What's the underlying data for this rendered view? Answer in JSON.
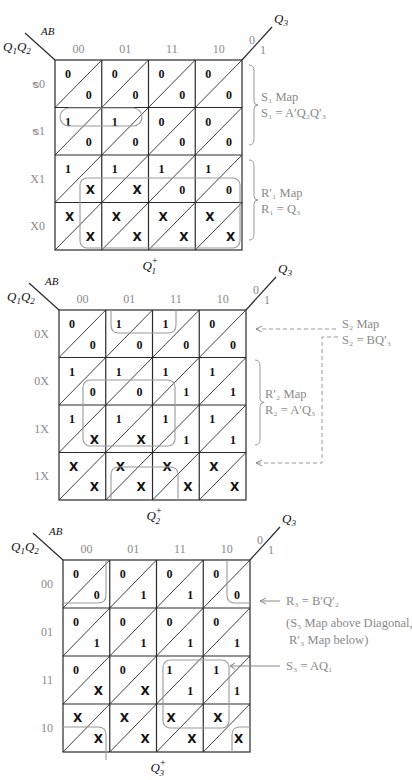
{
  "figure": {
    "col_header": "AB",
    "row_header": "Q1Q2",
    "diag_var": "Q3",
    "diag_top_label": "0",
    "diag_bottom_label": "1",
    "columns": [
      "00",
      "01",
      "11",
      "10"
    ]
  },
  "maps": [
    {
      "title": "Q1+",
      "row_labels": [
        "00",
        "01",
        "11",
        "10"
      ],
      "row_labels_rendered_garbled": [
        "Ø0",
        "Ø1",
        "X1",
        "X0"
      ],
      "upper": [
        [
          "0",
          "0",
          "0",
          "0"
        ],
        [
          "1",
          "1",
          "0",
          "0"
        ],
        [
          "1",
          "1",
          "1",
          "1"
        ],
        [
          "X",
          "X",
          "X",
          "X"
        ]
      ],
      "lower": [
        [
          "0",
          "0",
          "0",
          "0"
        ],
        [
          "0",
          "0",
          "0",
          "0"
        ],
        [
          "X",
          "X",
          "0",
          "0"
        ],
        [
          "X",
          "X",
          "X",
          "X"
        ]
      ],
      "annotations": [
        {
          "label": "S1 Map",
          "equation": "S1 = A'Q2Q3'"
        },
        {
          "label": "R1' Map",
          "equation": "R1 = Q3"
        }
      ]
    },
    {
      "title": "Q2+",
      "row_labels": [
        "00",
        "01",
        "11",
        "10"
      ],
      "row_labels_rendered_garbled": [
        "0X",
        "0X",
        "1X",
        "1X"
      ],
      "upper": [
        [
          "0",
          "1",
          "1",
          "0"
        ],
        [
          "1",
          "1",
          "1",
          "1"
        ],
        [
          "1",
          "1",
          "1",
          "1"
        ],
        [
          "X",
          "X",
          "X",
          "X"
        ]
      ],
      "lower": [
        [
          "0",
          "0",
          "0",
          "0"
        ],
        [
          "0",
          "0",
          "1",
          "1"
        ],
        [
          "X",
          "X",
          "1",
          "1"
        ],
        [
          "X",
          "X",
          "X",
          "X"
        ]
      ],
      "annotations": [
        {
          "label": "S2 Map",
          "equation": "S2 = BQ3'"
        },
        {
          "label": "R2' Map",
          "equation": "R2 = A'Q3"
        }
      ]
    },
    {
      "title": "Q3+",
      "row_labels": [
        "00",
        "01",
        "11",
        "10"
      ],
      "upper": [
        [
          "0",
          "0",
          "0",
          "0"
        ],
        [
          "0",
          "0",
          "0",
          "0"
        ],
        [
          "0",
          "0",
          "1",
          "1"
        ],
        [
          "X",
          "X",
          "X",
          "X"
        ]
      ],
      "lower": [
        [
          "0",
          "1",
          "1",
          "0"
        ],
        [
          "1",
          "1",
          "1",
          "1"
        ],
        [
          "X",
          "X",
          "1",
          "1"
        ],
        [
          "X",
          "X",
          "X",
          "X"
        ]
      ],
      "annotations": [
        {
          "label": "R3 = B'Q2'",
          "equation": ""
        },
        {
          "label": "(S3 Map above Diagonal,",
          "equation": "R3' Map below)"
        },
        {
          "label": "S3 = AQ1",
          "equation": ""
        }
      ]
    }
  ],
  "text": {
    "m1_title": "Q",
    "m1_title_sup": "+",
    "m1_title_sub": "1",
    "m2_title": "Q",
    "m2_title_sup": "+",
    "m2_title_sub": "2",
    "m3_title": "Q",
    "m3_title_sup": "+",
    "m3_title_sub": "3",
    "ab": "AB",
    "q1q2_q": "Q",
    "q1q2_1": "1",
    "q1q2_2": "2",
    "q3_q": "Q",
    "q3_sub": "3",
    "c0": "00",
    "c1": "01",
    "c2": "11",
    "c3": "10",
    "m1_rows": [
      "ᴓ0",
      "ᴓ1",
      "X1",
      "X0"
    ],
    "m2_rows": [
      "0X",
      "0X",
      "1X",
      "1X"
    ],
    "m3_rows": [
      "00",
      "01",
      "11",
      "10"
    ],
    "zero": "0",
    "one": "1",
    "s1_map": "S₁ Map",
    "s1_eq": "S₁ = A′Q₂Q′₃",
    "r1_map": "R′₁ Map",
    "r1_eq": "R₁ = Q₃",
    "s2_map": "S₂ Map",
    "s2_eq": "S₂ = BQ′₃",
    "r2_map": "R′₂ Map",
    "r2_eq": "R₂ = A′Q₃",
    "r3_eq": "R₃ = B′Q′₂",
    "s3_note1": "(S₃ Map above Diagonal,",
    "s3_note2": "R′₃ Map below)",
    "s3_eq": "S₃ = AQ₁"
  }
}
